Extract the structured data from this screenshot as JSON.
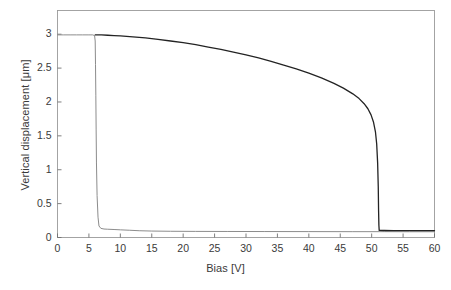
{
  "chart_data": {
    "type": "line",
    "title": "",
    "xlabel": "Bias [V]",
    "ylabel": "Vertical displacement [μm]",
    "xlim": [
      0,
      60
    ],
    "ylim": [
      0,
      3.35
    ],
    "xticks": [
      0,
      5,
      10,
      15,
      20,
      25,
      30,
      35,
      40,
      45,
      50,
      55,
      60
    ],
    "yticks": [
      0,
      0.5,
      1,
      1.5,
      2,
      2.5,
      3
    ],
    "xticklabels": [
      "0",
      "5",
      "10",
      "15",
      "20",
      "25",
      "30",
      "35",
      "40",
      "45",
      "50",
      "55",
      "60"
    ],
    "yticklabels": [
      "0",
      "0.5",
      "1",
      "1.5",
      "2",
      "2.5",
      "3"
    ],
    "grid": false,
    "legend": "none",
    "frame": "box",
    "series": [
      {
        "name": "pull-in branch",
        "color": "#8c8c8c",
        "linewidth": 1.0,
        "points": [
          [
            0.0,
            2.99
          ],
          [
            1.0,
            2.99
          ],
          [
            2.0,
            2.99
          ],
          [
            3.0,
            2.99
          ],
          [
            4.0,
            2.99
          ],
          [
            5.0,
            2.99
          ],
          [
            5.6,
            2.99
          ],
          [
            5.9,
            2.98
          ],
          [
            6.0,
            2.9
          ],
          [
            6.05,
            2.55
          ],
          [
            6.1,
            2.1
          ],
          [
            6.15,
            1.6
          ],
          [
            6.2,
            1.1
          ],
          [
            6.3,
            0.62
          ],
          [
            6.45,
            0.3
          ],
          [
            6.6,
            0.17
          ],
          [
            6.9,
            0.135
          ],
          [
            7.4,
            0.125
          ],
          [
            8.0,
            0.122
          ],
          [
            9.0,
            0.118
          ],
          [
            10.0,
            0.113
          ],
          [
            11.5,
            0.107
          ],
          [
            13.0,
            0.1
          ],
          [
            15.0,
            0.095
          ],
          [
            18.0,
            0.092
          ],
          [
            22.0,
            0.09
          ],
          [
            27.0,
            0.089
          ],
          [
            33.0,
            0.088
          ],
          [
            40.0,
            0.087
          ],
          [
            47.0,
            0.086
          ],
          [
            52.0,
            0.086
          ],
          [
            56.0,
            0.085
          ],
          [
            60.0,
            0.085
          ]
        ]
      },
      {
        "name": "release branch",
        "color": "#232323",
        "linewidth": 1.3,
        "points": [
          [
            6.0,
            2.99
          ],
          [
            7.0,
            2.99
          ],
          [
            8.0,
            2.985
          ],
          [
            9.0,
            2.98
          ],
          [
            10.0,
            2.975
          ],
          [
            12.0,
            2.96
          ],
          [
            14.0,
            2.945
          ],
          [
            16.0,
            2.925
          ],
          [
            18.0,
            2.9
          ],
          [
            20.0,
            2.875
          ],
          [
            22.0,
            2.845
          ],
          [
            24.0,
            2.81
          ],
          [
            26.0,
            2.775
          ],
          [
            28.0,
            2.735
          ],
          [
            30.0,
            2.695
          ],
          [
            32.0,
            2.65
          ],
          [
            34.0,
            2.6
          ],
          [
            36.0,
            2.545
          ],
          [
            38.0,
            2.49
          ],
          [
            40.0,
            2.425
          ],
          [
            42.0,
            2.355
          ],
          [
            44.0,
            2.275
          ],
          [
            45.5,
            2.205
          ],
          [
            47.0,
            2.12
          ],
          [
            48.0,
            2.05
          ],
          [
            48.8,
            1.975
          ],
          [
            49.4,
            1.9
          ],
          [
            49.9,
            1.81
          ],
          [
            50.3,
            1.7
          ],
          [
            50.6,
            1.56
          ],
          [
            50.8,
            1.38
          ],
          [
            50.95,
            1.1
          ],
          [
            51.05,
            0.75
          ],
          [
            51.1,
            0.4
          ],
          [
            51.15,
            0.18
          ],
          [
            51.2,
            0.105
          ],
          [
            52.0,
            0.103
          ],
          [
            53.5,
            0.102
          ],
          [
            56.0,
            0.101
          ],
          [
            58.0,
            0.1
          ],
          [
            60.0,
            0.1
          ]
        ]
      }
    ]
  },
  "caption": {
    "text": ""
  }
}
